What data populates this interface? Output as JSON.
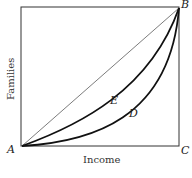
{
  "diagram": {
    "type": "lorenz-curve",
    "axes": {
      "x_label": "Income",
      "y_label": "Families"
    },
    "points": {
      "A": "A",
      "B": "B",
      "C": "C"
    },
    "curves": [
      {
        "label": "E",
        "description": "moderate inequality curve"
      },
      {
        "label": "D",
        "description": "greater inequality curve"
      }
    ],
    "diagonal": "line of equality A–B"
  }
}
